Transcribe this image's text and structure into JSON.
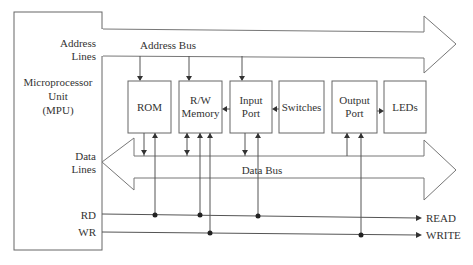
{
  "diagram": {
    "type": "block-diagram",
    "mpu": {
      "title_lines": [
        "Microprocessor",
        "Unit",
        "(MPU)"
      ],
      "address_label_lines": [
        "Address",
        "Lines"
      ],
      "data_label_lines": [
        "Data",
        "Lines"
      ],
      "rd_label": "RD",
      "wr_label": "WR"
    },
    "buses": {
      "address_bus": "Address Bus",
      "data_bus": "Data Bus"
    },
    "blocks": [
      {
        "id": "rom",
        "lines": [
          "ROM",
          ""
        ]
      },
      {
        "id": "rw-memory",
        "lines": [
          "R/W",
          "Memory"
        ]
      },
      {
        "id": "input-port",
        "lines": [
          "Input",
          "Port"
        ]
      },
      {
        "id": "switches",
        "lines": [
          "Switches",
          ""
        ]
      },
      {
        "id": "output-port",
        "lines": [
          "Output",
          "Port"
        ]
      },
      {
        "id": "leds",
        "lines": [
          "LEDs",
          ""
        ]
      }
    ],
    "control_outputs": {
      "read": "READ",
      "write": "WRITE"
    }
  }
}
